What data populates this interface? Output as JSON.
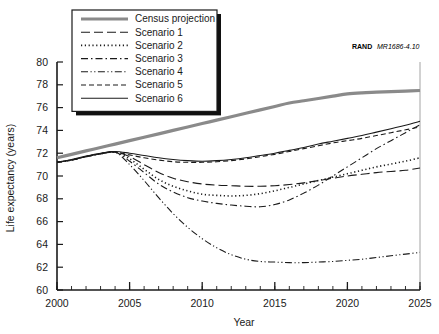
{
  "chart_data": {
    "type": "line",
    "title": "",
    "xlabel": "Year",
    "ylabel": "Life expectancy (years)",
    "xlim": [
      2000,
      2025
    ],
    "ylim": [
      60,
      80
    ],
    "xticks": [
      2000,
      2005,
      2010,
      2015,
      2020,
      2025
    ],
    "yticks": [
      60,
      62,
      64,
      66,
      68,
      70,
      72,
      74,
      76,
      78,
      80
    ],
    "xtick_labels": [
      "2000",
      "2005",
      "2010",
      "2015",
      "2020",
      "2025"
    ],
    "ytick_labels": [
      "60",
      "62",
      "64",
      "66",
      "68",
      "70",
      "72",
      "74",
      "76",
      "78",
      "80"
    ],
    "minor_xtick_interval": 1,
    "grid": false,
    "legend_position": "top-left",
    "x": [
      2000,
      2001,
      2002,
      2003,
      2004,
      2005,
      2006,
      2007,
      2008,
      2009,
      2010,
      2011,
      2012,
      2013,
      2014,
      2015,
      2016,
      2017,
      2018,
      2019,
      2020,
      2021,
      2022,
      2023,
      2024,
      2025
    ],
    "series": [
      {
        "name": "Census projection",
        "style": "thick-solid",
        "color": "#8a8a8a",
        "width": 3.2,
        "dash": "none",
        "values": [
          71.6,
          71.9,
          72.2,
          72.5,
          72.8,
          73.1,
          73.4,
          73.7,
          74.0,
          74.3,
          74.6,
          74.9,
          75.2,
          75.5,
          75.8,
          76.1,
          76.4,
          76.6,
          76.8,
          77.0,
          77.2,
          77.3,
          77.35,
          77.4,
          77.45,
          77.5
        ]
      },
      {
        "name": "Scenario 1",
        "style": "long-dash",
        "color": "#1a1a1a",
        "width": 1.1,
        "dash": "9,4",
        "values": [
          71.2,
          71.4,
          71.7,
          71.95,
          72.1,
          71.7,
          71.0,
          70.3,
          69.8,
          69.5,
          69.3,
          69.2,
          69.15,
          69.1,
          69.1,
          69.15,
          69.25,
          69.4,
          69.6,
          69.8,
          70.0,
          70.15,
          70.3,
          70.4,
          70.5,
          70.7
        ]
      },
      {
        "name": "Scenario 2",
        "style": "dotted",
        "color": "#1a1a1a",
        "width": 1.6,
        "dash": "1.2,2.6",
        "values": [
          71.2,
          71.4,
          71.7,
          71.95,
          72.1,
          71.5,
          70.6,
          69.7,
          69.1,
          68.7,
          68.4,
          68.3,
          68.25,
          68.3,
          68.45,
          68.7,
          69.0,
          69.3,
          69.6,
          69.9,
          70.2,
          70.5,
          70.8,
          71.05,
          71.3,
          71.6
        ]
      },
      {
        "name": "Scenario 3",
        "style": "dash-dot",
        "color": "#1a1a1a",
        "width": 1.1,
        "dash": "7,3,1.5,3",
        "values": [
          71.2,
          71.4,
          71.7,
          71.95,
          72.1,
          71.3,
          70.3,
          69.3,
          68.6,
          68.1,
          67.8,
          67.6,
          67.45,
          67.35,
          67.3,
          67.5,
          67.9,
          68.5,
          69.2,
          70.0,
          70.8,
          71.6,
          72.4,
          73.1,
          73.8,
          74.5
        ]
      },
      {
        "name": "Scenario 4",
        "style": "dash-dot-dot",
        "color": "#1a1a1a",
        "width": 1.1,
        "dash": "7,2.5,1.2,2.5,1.2,2.5",
        "values": [
          71.2,
          71.4,
          71.7,
          71.95,
          72.1,
          71.0,
          69.6,
          68.1,
          66.7,
          65.5,
          64.5,
          63.7,
          63.1,
          62.7,
          62.5,
          62.45,
          62.4,
          62.4,
          62.45,
          62.5,
          62.6,
          62.7,
          62.85,
          63.0,
          63.15,
          63.3
        ]
      },
      {
        "name": "Scenario 5",
        "style": "dashed",
        "color": "#1a1a1a",
        "width": 1.1,
        "dash": "5,3",
        "values": [
          71.2,
          71.4,
          71.7,
          71.95,
          72.1,
          71.85,
          71.6,
          71.4,
          71.25,
          71.2,
          71.2,
          71.25,
          71.35,
          71.5,
          71.7,
          71.9,
          72.15,
          72.4,
          72.65,
          72.9,
          73.1,
          73.3,
          73.55,
          73.8,
          74.05,
          74.3
        ]
      },
      {
        "name": "Scenario 6",
        "style": "solid",
        "color": "#1a1a1a",
        "width": 1.1,
        "dash": "none",
        "values": [
          71.2,
          71.45,
          71.75,
          72.0,
          72.15,
          72.0,
          71.8,
          71.6,
          71.45,
          71.35,
          71.3,
          71.35,
          71.45,
          71.6,
          71.8,
          72.0,
          72.25,
          72.5,
          72.8,
          73.05,
          73.3,
          73.55,
          73.85,
          74.15,
          74.45,
          74.8
        ]
      }
    ]
  },
  "credit": {
    "bold": "RAND",
    "italic": "MR1686-4.10"
  }
}
